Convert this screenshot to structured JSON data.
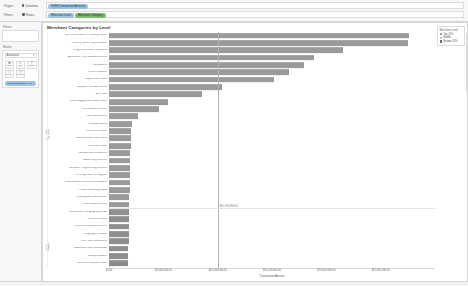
{
  "shelves": {
    "pages_label": "Pages",
    "filters_label": "Filters",
    "columns_label": "Columns",
    "rows_label": "Rows",
    "columns_pills": [
      {
        "text": "SUM(Transaction Amount)",
        "color": "#9dc3e0"
      }
    ],
    "rows_pills": [
      {
        "text": "Merchant Level",
        "color": "#9dc3e0"
      },
      {
        "text": "Merchant Category",
        "color": "#7fba6e"
      }
    ]
  },
  "marks": {
    "title": "Marks",
    "type": "Automatic",
    "caret": "▾",
    "buttons": [
      {
        "label": "Color",
        "glyph": "■"
      },
      {
        "label": "Size",
        "glyph": "↖"
      },
      {
        "label": "Label",
        "glyph": "T"
      },
      {
        "label": "Detail",
        "glyph": "☷"
      },
      {
        "label": "Tooltip",
        "glyph": "☰"
      }
    ],
    "encoded_pill": {
      "text": "SUM(Transaction Am..",
      "color": "#9dc3e0"
    }
  },
  "legend": {
    "title": "Merchant Level",
    "items": [
      {
        "label": "Top 20%",
        "color": "#9a9a9a"
      },
      {
        "label": "Middle",
        "color": "#9a9a9a"
      },
      {
        "label": "Bottom 20%",
        "color": "#6e6e6e"
      }
    ]
  },
  "chart_data": {
    "type": "bar",
    "orientation": "horizontal",
    "title": "Merchant Categories by Level",
    "xlabel": "Transaction Amount",
    "ylabel": "Merchant Category",
    "xlim": [
      0,
      30000000
    ],
    "xticks": [
      0,
      5000000,
      10000000,
      15000000,
      20000000,
      25000000
    ],
    "xtick_labels": [
      "$0.00",
      "$5,000,000.00",
      "$10,000,000.00",
      "$15,000,000.00",
      "$20,000,000.00",
      "$25,000,000.00"
    ],
    "grid": false,
    "legend_position": "right",
    "reference_line": {
      "value": 10000000,
      "label": "$10,159,900.00"
    },
    "band_label_top": "Top 20%",
    "band_label_bottom": "Middle",
    "bands": [
      {
        "name": "Top 20%",
        "count": 24
      },
      {
        "name": "Middle",
        "count": 8
      }
    ],
    "categories": [
      "Men's and Women's Clothing Stores",
      "Grocery Stores, Supermarkets",
      "Drug Stores and Pharmacies",
      "Automobile Parts and Accessories",
      "Restaurants",
      "Service Stations",
      "Department Stores",
      "Computer Software Stores",
      "Air Travel",
      "Home Supply Warehouse Stores",
      "Recreational Vehicles",
      "Hotels and Motels",
      "Discount Stores",
      "Electronics Stores",
      "Miscellaneous Food Stores",
      "Wholesale Clubs",
      "Taxicabs and Limousines",
      "Advertising Services",
      "Computer Programming Services",
      "Pet Shops and Pet Supplies",
      "Miscellaneous General Merchandise",
      "Health and Beauty Spas",
      "Cleaning and Maintenance",
      "Professional Services",
      "Commercial Photography and Art",
      "Cosmetic Stores",
      "Telecommunication Services",
      "Photographic Studios",
      "Fast Food Restaurants",
      "Bookstores and Newsstands",
      "Antique Dealers",
      "Used Merchandise Stores"
    ],
    "values": [
      27600000,
      27500000,
      21500000,
      18900000,
      17900000,
      16600000,
      15200000,
      10400000,
      8600000,
      5400000,
      4600000,
      2700000,
      2100000,
      2050000,
      2000000,
      1980000,
      1960000,
      1940000,
      1930000,
      1920000,
      1900000,
      1890000,
      1880000,
      1860000,
      1840000,
      1830000,
      1820000,
      1810000,
      1800000,
      1790000,
      1780000,
      1760000
    ],
    "bottom_axis_note": "$1,876,477.00"
  },
  "status": {
    "text": ""
  }
}
